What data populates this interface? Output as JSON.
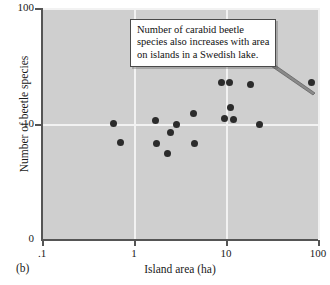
{
  "figure": {
    "panel_label": "(b)",
    "xlabel": "Island area (ha)",
    "ylabel": "Number of beetle species",
    "annotation_lines": [
      "Number of carabid beetle",
      "species also increases with area",
      "on islands in a Swedish lake."
    ],
    "colors": {
      "plot_background": "#cfcfcf",
      "gridline": "#f2f2f2",
      "point": "#2b2b2b",
      "axis": "#555555",
      "annotation_background": "#ffffff",
      "annotation_border": "#4a4a4a"
    }
  },
  "chart_data": {
    "type": "scatter",
    "title": "",
    "xlabel": "Island area (ha)",
    "ylabel": "Number of beetle species",
    "xscale": "log",
    "yscale": "log",
    "xlim": [
      0.1,
      100
    ],
    "ylim": [
      1,
      100
    ],
    "xticks": [
      0.1,
      1,
      10,
      100
    ],
    "xticklabels": [
      ".1",
      "1",
      "10",
      "100"
    ],
    "yticks": [
      10,
      100
    ],
    "yticklabels": [
      "10",
      "100"
    ],
    "y_axis_origin_label": "0",
    "grid": true,
    "legend": null,
    "annotations": [
      {
        "text": "Number of carabid beetle species also increases with area on islands in a Swedish lake.",
        "points_to_x": 85,
        "points_to_y": 23
      }
    ],
    "points": [
      {
        "x": 0.6,
        "y": 10.2
      },
      {
        "x": 0.72,
        "y": 6.9
      },
      {
        "x": 1.7,
        "y": 10.8
      },
      {
        "x": 1.75,
        "y": 6.8
      },
      {
        "x": 2.3,
        "y": 5.6
      },
      {
        "x": 2.5,
        "y": 8.4
      },
      {
        "x": 2.9,
        "y": 9.9
      },
      {
        "x": 4.4,
        "y": 12.4
      },
      {
        "x": 4.5,
        "y": 6.8
      },
      {
        "x": 9.0,
        "y": 22.8
      },
      {
        "x": 9.6,
        "y": 11.2
      },
      {
        "x": 11.0,
        "y": 22.8
      },
      {
        "x": 11.3,
        "y": 13.8
      },
      {
        "x": 12.0,
        "y": 10.9
      },
      {
        "x": 18.5,
        "y": 22.0
      },
      {
        "x": 23.0,
        "y": 10.0
      },
      {
        "x": 85.0,
        "y": 22.6
      }
    ]
  }
}
